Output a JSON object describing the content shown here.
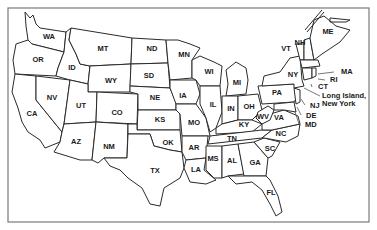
{
  "map": {
    "title": "United States",
    "states": [
      {
        "abbr": "WA",
        "x": 49,
        "y": 37
      },
      {
        "abbr": "OR",
        "x": 38,
        "y": 60
      },
      {
        "abbr": "CA",
        "x": 32,
        "y": 114
      },
      {
        "abbr": "NV",
        "x": 52,
        "y": 98
      },
      {
        "abbr": "ID",
        "x": 72,
        "y": 68
      },
      {
        "abbr": "MT",
        "x": 103,
        "y": 49
      },
      {
        "abbr": "WY",
        "x": 111,
        "y": 81
      },
      {
        "abbr": "UT",
        "x": 81,
        "y": 106
      },
      {
        "abbr": "CO",
        "x": 117,
        "y": 113
      },
      {
        "abbr": "AZ",
        "x": 76,
        "y": 142
      },
      {
        "abbr": "NM",
        "x": 109,
        "y": 147
      },
      {
        "abbr": "ND",
        "x": 152,
        "y": 49
      },
      {
        "abbr": "SD",
        "x": 149,
        "y": 76
      },
      {
        "abbr": "NE",
        "x": 155,
        "y": 98
      },
      {
        "abbr": "KS",
        "x": 160,
        "y": 120
      },
      {
        "abbr": "OK",
        "x": 168,
        "y": 143
      },
      {
        "abbr": "TX",
        "x": 155,
        "y": 171
      },
      {
        "abbr": "MN",
        "x": 184,
        "y": 55
      },
      {
        "abbr": "IA",
        "x": 183,
        "y": 96
      },
      {
        "abbr": "MO",
        "x": 194,
        "y": 123
      },
      {
        "abbr": "AR",
        "x": 194,
        "y": 148
      },
      {
        "abbr": "LA",
        "x": 196,
        "y": 170
      },
      {
        "abbr": "WI",
        "x": 209,
        "y": 72
      },
      {
        "abbr": "IL",
        "x": 213,
        "y": 105
      },
      {
        "abbr": "MI",
        "x": 237,
        "y": 83
      },
      {
        "abbr": "IN",
        "x": 231,
        "y": 109
      },
      {
        "abbr": "OH",
        "x": 249,
        "y": 107
      },
      {
        "abbr": "KY",
        "x": 244,
        "y": 125
      },
      {
        "abbr": "TN",
        "x": 232,
        "y": 139
      },
      {
        "abbr": "MS",
        "x": 213,
        "y": 159
      },
      {
        "abbr": "AL",
        "x": 232,
        "y": 161
      },
      {
        "abbr": "GA",
        "x": 255,
        "y": 163
      },
      {
        "abbr": "FL",
        "x": 271,
        "y": 193
      },
      {
        "abbr": "SC",
        "x": 270,
        "y": 149
      },
      {
        "abbr": "NC",
        "x": 281,
        "y": 134
      },
      {
        "abbr": "VA",
        "x": 279,
        "y": 118
      },
      {
        "abbr": "WV",
        "x": 263,
        "y": 117
      },
      {
        "abbr": "PA",
        "x": 277,
        "y": 93
      },
      {
        "abbr": "NY",
        "x": 293,
        "y": 75
      },
      {
        "abbr": "VT",
        "x": 286,
        "y": 49
      },
      {
        "abbr": "NH",
        "x": 300,
        "y": 43
      },
      {
        "abbr": "ME",
        "x": 328,
        "y": 32
      }
    ],
    "callouts": [
      {
        "abbr": "MA",
        "x": 341,
        "y": 72,
        "lx1": 318,
        "ly1": 74,
        "lx2": 334,
        "ly2": 72
      },
      {
        "abbr": "RI",
        "x": 330,
        "y": 80,
        "lx1": 318,
        "ly1": 79,
        "lx2": 325,
        "ly2": 80
      },
      {
        "abbr": "CT",
        "x": 318,
        "y": 87,
        "lx1": 311,
        "ly1": 84,
        "lx2": 312,
        "ly2": 87
      },
      {
        "abbr": "NJ",
        "x": 310,
        "y": 106,
        "lx1": 301,
        "ly1": 99,
        "lx2": 305,
        "ly2": 105
      },
      {
        "abbr": "DE",
        "x": 306,
        "y": 116,
        "lx1": 297,
        "ly1": 107,
        "lx2": 301,
        "ly2": 115
      },
      {
        "abbr": "MD",
        "x": 305,
        "y": 125,
        "lx1": 295,
        "ly1": 112,
        "lx2": 299,
        "ly2": 124
      }
    ],
    "long_island": {
      "line1": "Long Island,",
      "line2": "New York",
      "x": 322,
      "y1": 96,
      "y2": 104,
      "lx1": 304,
      "ly1": 88,
      "lx2": 320,
      "ly2": 96
    }
  }
}
